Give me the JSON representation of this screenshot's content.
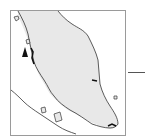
{
  "map": {
    "subject": "Peninsular Malaysia coastline inset map",
    "colors": {
      "land": "#e8e8e8",
      "sea": "#ffffff",
      "coastline": "#333333",
      "frame": "#9a9a9a",
      "marker": "#111111"
    },
    "frame": {
      "x": 10,
      "y": 10,
      "width": 116,
      "height": 126
    },
    "marker": {
      "type": "location-triangle",
      "x": 25,
      "y": 52
    },
    "leader_line": {
      "x1": 128,
      "x2": 145,
      "y": 72
    }
  }
}
